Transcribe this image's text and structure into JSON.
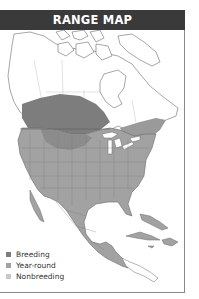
{
  "header": {
    "title": "RANGE MAP"
  },
  "map": {
    "region": "North America",
    "colors": {
      "breeding": "#7d7d7d",
      "year_round": "#a2a2a2",
      "nonbreeding": "#c8c8c8",
      "land_outline": "#6a6a6a",
      "water": "#ffffff",
      "header_bg": "#3a3a3a"
    }
  },
  "legend": {
    "items": [
      {
        "label": "Breeding",
        "color": "#7d7d7d"
      },
      {
        "label": "Year-round",
        "color": "#a2a2a2"
      },
      {
        "label": "Nonbreeding",
        "color": "#c8c8c8"
      }
    ]
  }
}
